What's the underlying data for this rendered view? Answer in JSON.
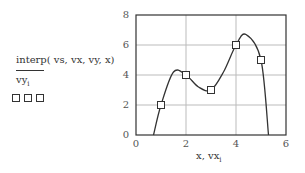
{
  "chart_data": {
    "type": "line",
    "title": "",
    "xlabel": "x, vx_i",
    "ylabel": "interp( vs, vx, vy, x) / vy_i",
    "xlim": [
      0,
      6
    ],
    "ylim": [
      0,
      8
    ],
    "xticks": [
      0,
      2,
      4,
      6
    ],
    "yticks": [
      0,
      2,
      4,
      6,
      8
    ],
    "grid": true,
    "series": [
      {
        "name": "interp( vs, vx, vy, x)",
        "style": "line",
        "x": [
          0.7,
          1,
          1.5,
          2,
          2.5,
          3,
          3.5,
          4,
          4.4,
          5,
          5.3
        ],
        "y": [
          0,
          2,
          4.2,
          4,
          3.2,
          3,
          4.2,
          6,
          6.7,
          5,
          0
        ]
      },
      {
        "name": "vy_i",
        "style": "square-markers",
        "x": [
          1,
          2,
          3,
          4,
          5
        ],
        "y": [
          2,
          4,
          3,
          6,
          5
        ]
      }
    ]
  },
  "labels": {
    "y_top": "interp( vs, vx, vy, x)",
    "y_bottom": "vy",
    "y_bottom_sub": "i",
    "x_main": "x, vx",
    "x_sub": "i"
  }
}
